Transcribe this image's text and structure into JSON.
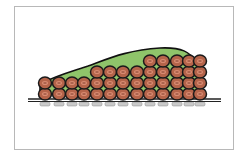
{
  "figure": {
    "colors": {
      "background": "#ffffff",
      "frame": "#b8b8b8",
      "matrix_fill": "#8fc46a",
      "matrix_outline": "#111111",
      "cell_fill": "#b5644a",
      "cell_outline": "#1a1a1a",
      "cell_inner": "#d98b72",
      "surface": "#222222",
      "attachment": "#c9c9c9"
    },
    "surface": {
      "x1": 28,
      "x2": 221,
      "y": 100
    },
    "matrix_path": "M 40 84 C 55 76, 70 72, 88 66 C 110 58, 128 50, 160 48 C 182 47, 190 52, 196 62 L 202 92 L 40 94 Z",
    "columns": [
      {
        "x": 45,
        "cells": 2
      },
      {
        "x": 59,
        "cells": 2
      },
      {
        "x": 72,
        "cells": 2
      },
      {
        "x": 84,
        "cells": 2
      },
      {
        "x": 97,
        "cells": 3
      },
      {
        "x": 110,
        "cells": 3
      },
      {
        "x": 123,
        "cells": 3
      },
      {
        "x": 137,
        "cells": 3
      },
      {
        "x": 150,
        "cells": 4
      },
      {
        "x": 163,
        "cells": 4
      },
      {
        "x": 177,
        "cells": 4
      },
      {
        "x": 189,
        "cells": 4
      },
      {
        "x": 200,
        "cells": 4
      }
    ],
    "cell_radius": 6,
    "row_spacing": 11,
    "base_cell_y": 94
  }
}
